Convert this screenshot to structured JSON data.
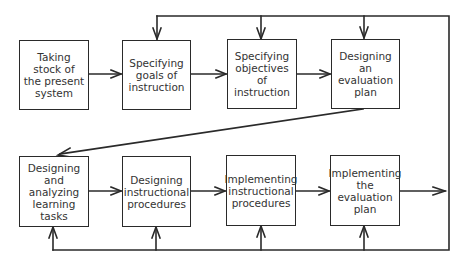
{
  "diagram": {
    "title": "",
    "colors": {
      "line": "#2a2a2a",
      "text": "#333333",
      "background": "#ffffff"
    },
    "top_row": [
      {
        "id": "taking-stock",
        "label": "Taking\nstock of\nthe present\nsystem"
      },
      {
        "id": "specifying-goals",
        "label": "Specifying\ngoals of\ninstruction"
      },
      {
        "id": "specifying-objectives",
        "label": "Specifying\nobjectives\nof\ninstruction"
      },
      {
        "id": "designing-evaluation-plan",
        "label": "Designing\nan\nevaluation\nplan"
      }
    ],
    "bottom_row": [
      {
        "id": "designing-learning-tasks",
        "label": "Designing\nand\nanalyzing\nlearning\ntasks"
      },
      {
        "id": "designing-procedures",
        "label": "Designing\ninstructional\nprocedures"
      },
      {
        "id": "implementing-procedures",
        "label": "Implementing\ninstructional\nprocedures"
      },
      {
        "id": "implementing-evaluation-plan",
        "label": "Implementing\nthe\nevaluation\nplan"
      }
    ],
    "connections": [
      {
        "from": "taking-stock",
        "to": "specifying-goals"
      },
      {
        "from": "specifying-goals",
        "to": "specifying-objectives"
      },
      {
        "from": "specifying-objectives",
        "to": "designing-evaluation-plan"
      },
      {
        "from": "designing-evaluation-plan",
        "to": "designing-learning-tasks"
      },
      {
        "from": "designing-learning-tasks",
        "to": "designing-procedures"
      },
      {
        "from": "designing-procedures",
        "to": "implementing-procedures"
      },
      {
        "from": "implementing-procedures",
        "to": "implementing-evaluation-plan"
      },
      {
        "from": "implementing-evaluation-plan",
        "to": "feedback-loop"
      },
      {
        "from": "feedback-loop",
        "to": "specifying-goals"
      },
      {
        "from": "feedback-loop",
        "to": "specifying-objectives"
      },
      {
        "from": "feedback-loop",
        "to": "designing-evaluation-plan"
      },
      {
        "from": "feedback-loop",
        "to": "designing-learning-tasks"
      },
      {
        "from": "feedback-loop",
        "to": "designing-procedures"
      },
      {
        "from": "feedback-loop",
        "to": "implementing-procedures"
      },
      {
        "from": "feedback-loop",
        "to": "implementing-evaluation-plan"
      }
    ]
  }
}
